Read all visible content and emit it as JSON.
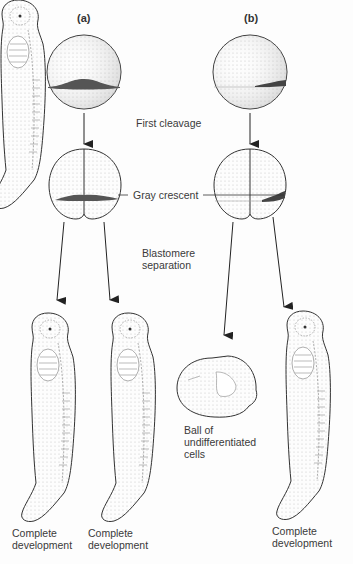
{
  "panels": {
    "a": {
      "label": "(a)"
    },
    "b": {
      "label": "(b)"
    }
  },
  "stages": {
    "first_cleavage": "First cleavage",
    "gray_crescent": "Gray crescent",
    "blastomere_separation_line1": "Blastomere",
    "blastomere_separation_line2": "separation"
  },
  "outcomes": {
    "a_left": {
      "line1": "Complete",
      "line2": "development"
    },
    "a_right": {
      "line1": "Complete",
      "line2": "development"
    },
    "b_left": {
      "line1": "Ball of",
      "line2": "undifferentiated",
      "line3": "cells"
    },
    "b_right": {
      "line1": "Complete",
      "line2": "development"
    }
  },
  "colors": {
    "outline": "#333333",
    "crescent": "#555555",
    "stipple": "#bbbbbb"
  }
}
